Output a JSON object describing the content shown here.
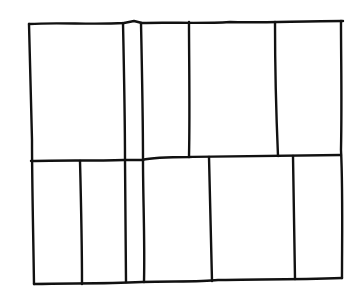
{
  "diagram": {
    "type": "hand-drawn grid sketch",
    "stroke_color": "#111111",
    "background_color": "#ffffff",
    "stroke_width": 2.4,
    "outer_frame": {
      "left": 28,
      "top": 22,
      "right": 343,
      "bottom": 284
    },
    "row_divider_y": 160,
    "full_height_dividers_x": [
      124,
      142
    ],
    "top_row_dividers_x": [
      189,
      275
    ],
    "bottom_row_dividers_x": [
      80,
      210,
      294
    ],
    "cells": {
      "top_row": [
        {
          "id": "t1",
          "x0": 28,
          "x1": 124
        },
        {
          "id": "t2",
          "x0": 124,
          "x1": 142
        },
        {
          "id": "t3",
          "x0": 142,
          "x1": 189
        },
        {
          "id": "t4",
          "x0": 189,
          "x1": 275
        },
        {
          "id": "t5",
          "x0": 275,
          "x1": 343
        }
      ],
      "bottom_row": [
        {
          "id": "b1",
          "x0": 28,
          "x1": 80
        },
        {
          "id": "b2",
          "x0": 80,
          "x1": 124
        },
        {
          "id": "b3",
          "x0": 124,
          "x1": 142
        },
        {
          "id": "b4",
          "x0": 142,
          "x1": 210
        },
        {
          "id": "b5",
          "x0": 210,
          "x1": 294
        },
        {
          "id": "b6",
          "x0": 294,
          "x1": 343
        }
      ]
    }
  }
}
